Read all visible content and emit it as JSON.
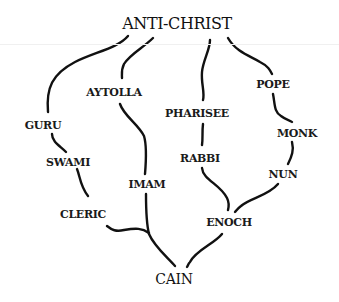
{
  "diagram": {
    "type": "genealogy-tree",
    "root": "ANTI-CHRIST",
    "terminal": "CAIN",
    "nodes": {
      "anti_christ": "ANTI-CHRIST",
      "aytolla": "AYTOLLA",
      "guru": "GURU",
      "pharisee": "PHARISEE",
      "pope": "POPE",
      "monk": "MONK",
      "swami": "SWAMI",
      "rabbi": "RABBI",
      "nun": "NUN",
      "imam": "IMAM",
      "cleric": "CLERIC",
      "enoch": "ENOCH",
      "cain": "CAIN"
    },
    "edges": [
      [
        "ANTI-CHRIST",
        "GURU"
      ],
      [
        "ANTI-CHRIST",
        "AYTOLLA"
      ],
      [
        "ANTI-CHRIST",
        "PHARISEE"
      ],
      [
        "ANTI-CHRIST",
        "POPE"
      ],
      [
        "GURU",
        "SWAMI"
      ],
      [
        "SWAMI",
        "CLERIC"
      ],
      [
        "AYTOLLA",
        "IMAM"
      ],
      [
        "PHARISEE",
        "RABBI"
      ],
      [
        "POPE",
        "MONK"
      ],
      [
        "MONK",
        "NUN"
      ],
      [
        "RABBI",
        "ENOCH"
      ],
      [
        "NUN",
        "ENOCH"
      ],
      [
        "CLERIC",
        "CAIN"
      ],
      [
        "IMAM",
        "CAIN"
      ],
      [
        "ENOCH",
        "CAIN"
      ]
    ]
  }
}
